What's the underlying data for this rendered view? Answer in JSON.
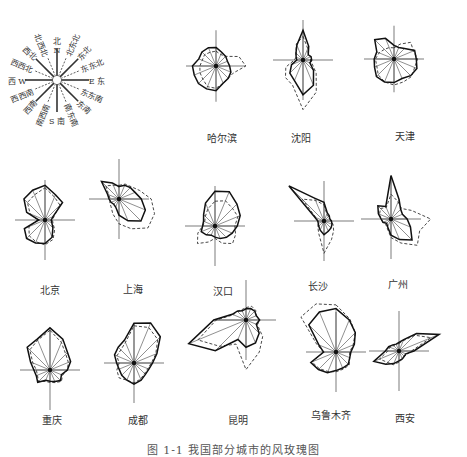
{
  "chart_data": {
    "type": "radar",
    "title": "",
    "caption": "图 1-1  我国部分城市的风玫瑰图",
    "directions": [
      "N",
      "NNE",
      "NE",
      "ENE",
      "E",
      "ESE",
      "SE",
      "SSE",
      "S",
      "SSW",
      "SW",
      "WSW",
      "W",
      "WNW",
      "NW",
      "NNW"
    ],
    "legend": {
      "compass_labels": [
        "北",
        "北东北",
        "东北",
        "东东北",
        "E 东",
        "东东南",
        "东南",
        "南东南",
        "S 南",
        "南西南",
        "西南",
        "西西南",
        "西 W",
        "西西北",
        "西北",
        "北西北"
      ],
      "north_letter": "N",
      "series_styles": [
        {
          "name": "solid",
          "style": "solid line"
        },
        {
          "name": "dashed",
          "style": "dashed line"
        }
      ]
    },
    "cities": [
      {
        "name": "哈尔滨",
        "cx": 216,
        "cy": 66,
        "label_x": 222,
        "label_y": 130,
        "solid": [
          30,
          24,
          22,
          20,
          22,
          26,
          28,
          30,
          40,
          40,
          40,
          38,
          38,
          30,
          32,
          32
        ],
        "dashed": [
          24,
          20,
          22,
          40,
          48,
          30,
          28,
          30,
          36,
          36,
          30,
          28,
          26,
          24,
          26,
          24
        ]
      },
      {
        "name": "沈阳",
        "cx": 303,
        "cy": 60,
        "label_x": 301,
        "label_y": 130,
        "solid": [
          48,
          24,
          12,
          14,
          14,
          12,
          24,
          44,
          56,
          36,
          30,
          20,
          10,
          12,
          16,
          26
        ],
        "dashed": [
          38,
          20,
          12,
          14,
          12,
          16,
          30,
          56,
          80,
          44,
          40,
          30,
          14,
          12,
          16,
          28
        ]
      },
      {
        "name": "天津",
        "cx": 394,
        "cy": 59,
        "label_x": 405,
        "label_y": 128,
        "solid": [
          22,
          20,
          24,
          36,
          36,
          40,
          38,
          34,
          38,
          40,
          40,
          34,
          32,
          30,
          44,
          36
        ],
        "dashed": [
          18,
          26,
          38,
          34,
          38,
          36,
          40,
          40,
          42,
          40,
          36,
          30,
          30,
          26,
          22,
          20
        ]
      },
      {
        "name": "北京",
        "cx": 45,
        "cy": 220,
        "label_x": 50,
        "label_y": 282,
        "solid": [
          56,
          44,
          40,
          14,
          10,
          12,
          18,
          30,
          38,
          40,
          42,
          36,
          10,
          32,
          48,
          52
        ],
        "dashed": [
          52,
          40,
          34,
          16,
          12,
          14,
          22,
          34,
          40,
          38,
          36,
          28,
          12,
          26,
          40,
          44
        ]
      },
      {
        "name": "上海",
        "cx": 119,
        "cy": 199,
        "label_x": 133,
        "label_y": 281,
        "solid": [
          20,
          24,
          26,
          28,
          36,
          46,
          50,
          38,
          26,
          14,
          12,
          14,
          16,
          20,
          40,
          28
        ],
        "dashed": [
          22,
          26,
          28,
          36,
          52,
          62,
          66,
          52,
          40,
          26,
          18,
          16,
          14,
          18,
          30,
          24
        ],
        "fan_rays": true
      },
      {
        "name": "汉口",
        "cx": 215,
        "cy": 226,
        "label_x": 223,
        "label_y": 283,
        "solid": [
          56,
          60,
          50,
          44,
          36,
          30,
          26,
          22,
          18,
          16,
          20,
          24,
          20,
          20,
          26,
          40
        ],
        "dashed": [
          40,
          44,
          40,
          40,
          32,
          36,
          40,
          30,
          20,
          28,
          40,
          30,
          20,
          18,
          22,
          30
        ]
      },
      {
        "name": "长沙",
        "cx": 324,
        "cy": 221,
        "label_x": 318,
        "label_y": 278,
        "solid": [
          30,
          14,
          12,
          10,
          12,
          14,
          16,
          18,
          22,
          16,
          12,
          10,
          10,
          16,
          80,
          40
        ],
        "dashed": [
          26,
          12,
          10,
          10,
          12,
          16,
          22,
          32,
          52,
          22,
          14,
          10,
          10,
          14,
          50,
          36
        ]
      },
      {
        "name": "广州",
        "cx": 391,
        "cy": 219,
        "label_x": 398,
        "label_y": 276,
        "solid": [
          70,
          34,
          22,
          20,
          26,
          34,
          48,
          36,
          26,
          14,
          10,
          14,
          16,
          22,
          30,
          22
        ],
        "dashed": [
          40,
          30,
          24,
          36,
          64,
          50,
          60,
          42,
          30,
          16,
          12,
          14,
          16,
          20,
          24,
          20
        ]
      },
      {
        "name": "重庆",
        "cx": 50,
        "cy": 370,
        "label_x": 52,
        "label_y": 412,
        "solid": [
          68,
          54,
          40,
          36,
          28,
          20,
          24,
          20,
          18,
          18,
          28,
          24,
          26,
          34,
          52,
          54
        ],
        "dashed": [
          64,
          48,
          36,
          32,
          28,
          22,
          26,
          22,
          20,
          20,
          26,
          22,
          22,
          30,
          46,
          52
        ]
      },
      {
        "name": "成都",
        "cx": 134,
        "cy": 363,
        "label_x": 138,
        "label_y": 412,
        "solid": [
          64,
          70,
          60,
          40,
          30,
          26,
          26,
          30,
          34,
          30,
          28,
          26,
          28,
          34,
          36,
          40
        ],
        "dashed": [
          60,
          62,
          54,
          38,
          28,
          24,
          24,
          28,
          32,
          30,
          34,
          30,
          24,
          30,
          30,
          36
        ],
        "fan_rays": true
      },
      {
        "name": "昆明",
        "cx": 246,
        "cy": 320,
        "label_x": 238,
        "label_y": 412,
        "solid": [
          18,
          20,
          20,
          18,
          22,
          18,
          30,
          40,
          44,
          34,
          70,
          100,
          52,
          24,
          20,
          16
        ],
        "dashed": [
          20,
          24,
          22,
          18,
          22,
          20,
          38,
          56,
          80,
          42,
          60,
          84,
          48,
          22,
          20,
          18
        ]
      },
      {
        "name": "乌鲁木齐",
        "cx": 336,
        "cy": 352,
        "label_x": 331,
        "label_y": 407,
        "solid": [
          70,
          56,
          44,
          32,
          24,
          24,
          28,
          28,
          30,
          36,
          40,
          44,
          20,
          30,
          62,
          70
        ],
        "dashed": [
          76,
          58,
          44,
          30,
          22,
          24,
          30,
          30,
          32,
          34,
          38,
          42,
          20,
          34,
          80,
          84
        ]
      },
      {
        "name": "西安",
        "cx": 399,
        "cy": 351,
        "label_x": 405,
        "label_y": 410,
        "solid": [
          14,
          20,
          40,
          70,
          24,
          12,
          12,
          14,
          16,
          22,
          30,
          44,
          22,
          18,
          14,
          12
        ],
        "dashed": [
          12,
          18,
          36,
          56,
          20,
          14,
          12,
          14,
          18,
          24,
          26,
          34,
          18,
          16,
          12,
          12
        ]
      }
    ],
    "compass": {
      "cx": 57,
      "cy": 80,
      "r": 46
    }
  }
}
